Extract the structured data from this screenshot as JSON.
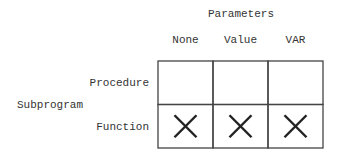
{
  "title": "Parameters",
  "side_label": "Subprogram",
  "columns": [
    "None",
    "Value",
    "VAR"
  ],
  "rows": [
    {
      "label": "Procedure",
      "cells": [
        false,
        false,
        false
      ]
    },
    {
      "label": "Function",
      "cells": [
        true,
        true,
        true
      ]
    }
  ],
  "mark_symbol": "cross",
  "colors": {
    "line": "#444444",
    "mark": "#222222",
    "text": "#333333"
  }
}
